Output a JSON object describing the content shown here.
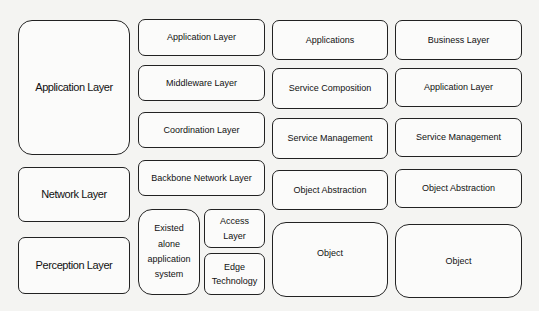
{
  "columns": [
    {
      "name": "three-layer",
      "boxes": [
        {
          "label": "Application Layer"
        },
        {
          "label": "Network Layer"
        },
        {
          "label": "Perception Layer"
        }
      ]
    },
    {
      "name": "middleware-based",
      "boxes": [
        {
          "label": "Application Layer"
        },
        {
          "label": "Middleware Layer"
        },
        {
          "label": "Coordination Layer"
        },
        {
          "label": "Backbone Network Layer"
        },
        {
          "label": "Existed alone application system"
        },
        {
          "label": "Access Layer"
        },
        {
          "label": "Edge Technology"
        }
      ]
    },
    {
      "name": "soa-based",
      "boxes": [
        {
          "label": "Applications"
        },
        {
          "label": "Service Composition"
        },
        {
          "label": "Service Management"
        },
        {
          "label": "Object Abstraction"
        },
        {
          "label": "Object"
        }
      ]
    },
    {
      "name": "five-layer",
      "boxes": [
        {
          "label": "Business Layer"
        },
        {
          "label": "Application Layer"
        },
        {
          "label": "Service Management"
        },
        {
          "label": "Object Abstraction"
        },
        {
          "label": "Object"
        }
      ]
    }
  ]
}
